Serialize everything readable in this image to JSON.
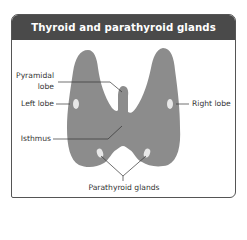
{
  "title": "Thyroid and parathyroid glands",
  "labels": {
    "pyramidal_lobe_line1": "Pyramidal",
    "pyramidal_lobe_line2": "lobe",
    "left_lobe": "Left lobe",
    "right_lobe": "Right lobe",
    "isthmus": "Isthmus",
    "parathyroid_glands": "Parathyroid glands"
  },
  "colors": {
    "header_bg": "#4a4a4a",
    "gland_fill": "#8c8c8c",
    "spot_fill": "#e8e8e8",
    "leader_line": "#333333"
  }
}
